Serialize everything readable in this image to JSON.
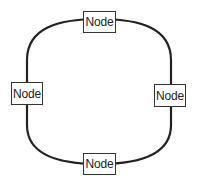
{
  "diagram": {
    "type": "ring-topology",
    "colors": {
      "background": "#ffffff",
      "ring": "#222222",
      "node_border": "#333333",
      "node_text": "#222222"
    },
    "nodes": [
      {
        "id": "top",
        "label": "Node"
      },
      {
        "id": "left",
        "label": "Node"
      },
      {
        "id": "right",
        "label": "Node"
      },
      {
        "id": "bottom",
        "label": "Node"
      }
    ],
    "edges": [
      {
        "from": "top",
        "to": "right"
      },
      {
        "from": "right",
        "to": "bottom"
      },
      {
        "from": "bottom",
        "to": "left"
      },
      {
        "from": "left",
        "to": "top"
      }
    ]
  }
}
